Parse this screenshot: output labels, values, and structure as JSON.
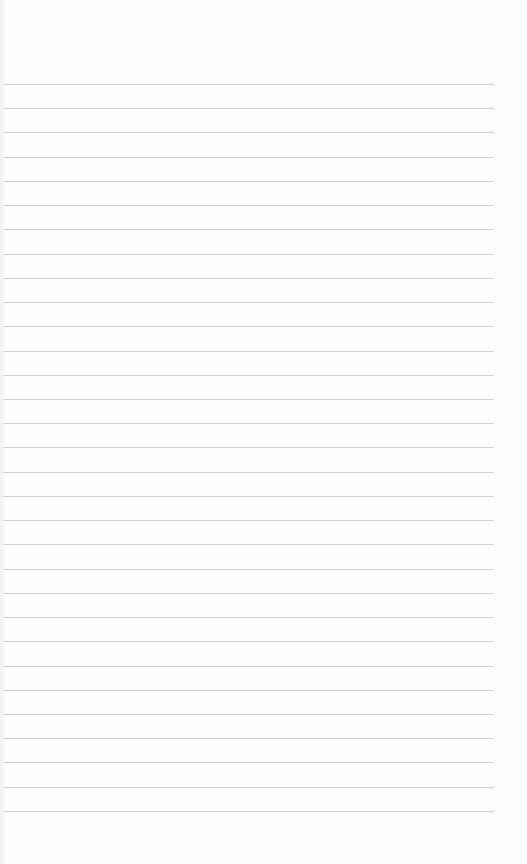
{
  "paper": {
    "type": "lined-paper",
    "background_color": "#fefefe",
    "line_color": "#cfcfcf",
    "line_count": 31,
    "first_line_y": 84,
    "line_spacing": 24.23,
    "line_left": 3,
    "line_right": 494
  }
}
